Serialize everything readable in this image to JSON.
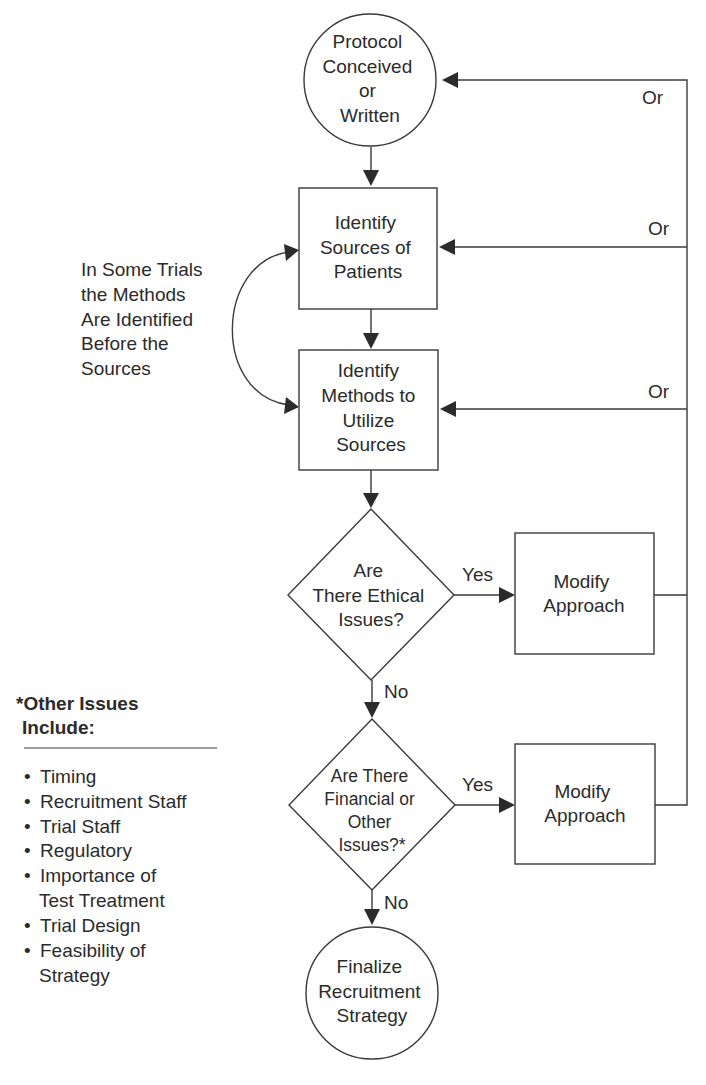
{
  "nodes": {
    "protocol": {
      "shape": "circle",
      "lines": [
        "Protocol",
        "Conceived",
        "or",
        "Written"
      ]
    },
    "sources": {
      "shape": "box",
      "lines": [
        "Identify",
        "Sources of",
        "Patients"
      ]
    },
    "methods": {
      "shape": "box",
      "lines": [
        "Identify",
        "Methods to",
        "Utilize",
        "Sources"
      ]
    },
    "ethical": {
      "shape": "diamond",
      "lines": [
        "Are",
        "There Ethical",
        "Issues?"
      ]
    },
    "modify1": {
      "shape": "box",
      "lines": [
        "Modify",
        "Approach"
      ]
    },
    "financial": {
      "shape": "diamond",
      "lines": [
        "Are There",
        "Financial or",
        "Other",
        "Issues?*"
      ]
    },
    "modify2": {
      "shape": "box",
      "lines": [
        "Modify",
        "Approach"
      ]
    },
    "finalize": {
      "shape": "circle",
      "lines": [
        "Finalize",
        "Recruitment",
        "Strategy"
      ]
    }
  },
  "edge_labels": {
    "or_top": "Or",
    "or_sources": "Or",
    "or_methods": "Or",
    "yes_ethical": "Yes",
    "no_ethical": "No",
    "yes_financial": "Yes",
    "no_financial": "No"
  },
  "side_note": {
    "lines": [
      "In Some Trials",
      "the Methods",
      "Are Identified",
      "Before the",
      "Sources"
    ]
  },
  "other_issues": {
    "heading_lines": [
      "*Other Issues",
      " Include:"
    ],
    "items": [
      [
        "Timing"
      ],
      [
        "Recruitment Staff"
      ],
      [
        "Trial Staff"
      ],
      [
        "Regulatory"
      ],
      [
        "Importance of",
        "Test Treatment"
      ],
      [
        "Trial Design"
      ],
      [
        "Feasibility of",
        "Strategy"
      ]
    ]
  },
  "colors": {
    "line": "#3a3a3a",
    "text": "#2b2b2b",
    "background": "#ffffff"
  }
}
